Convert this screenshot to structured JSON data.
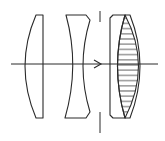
{
  "diagram": {
    "type": "optical-lens-schematic",
    "colors": {
      "line": "#2a2a2a",
      "background": "#ffffff"
    },
    "optical_axis": {
      "y": 64,
      "x_start": 11,
      "x_end": 158,
      "arrow_x": 100,
      "direction": "left-to-right"
    },
    "aperture_stop": {
      "x": 100,
      "top_segment": [
        11,
        22
      ],
      "bottom_segment": [
        112,
        133
      ]
    },
    "elements": [
      {
        "id": "lens-1",
        "kind": "plano-convex",
        "hatch": "horizontal",
        "x_range": [
          23,
          43
        ],
        "y_range": [
          15,
          118
        ]
      },
      {
        "id": "lens-2",
        "kind": "biconcave",
        "hatch": "diagonal",
        "x_range": [
          66,
          90
        ],
        "y_range": [
          15,
          118
        ]
      },
      {
        "id": "lens-3a",
        "kind": "plano-concave (cemented)",
        "hatch": "vertical",
        "x_range": [
          110,
          125
        ],
        "y_range": [
          15,
          118
        ]
      },
      {
        "id": "lens-3b",
        "kind": "biconvex (cemented)",
        "hatch": "horizontal",
        "x_range": [
          117,
          146
        ],
        "y_range": [
          15,
          118
        ]
      }
    ]
  }
}
